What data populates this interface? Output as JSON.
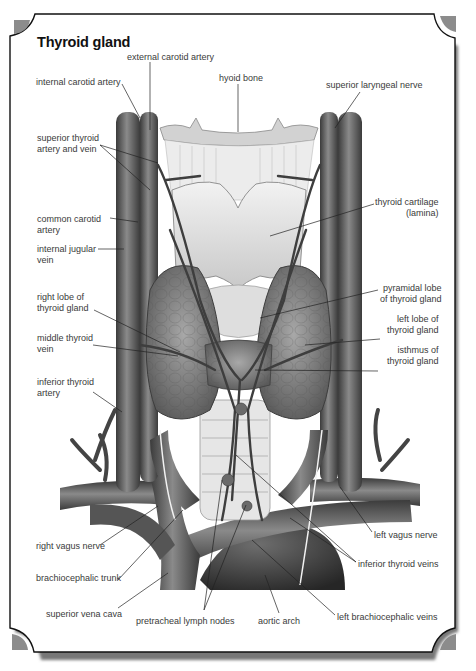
{
  "title": "Thyroid gland",
  "colors": {
    "frame_stroke": "#111111",
    "frame_shadow": "#7a7a7a",
    "corner_fill": "#8c8c8c",
    "vessel_dark": "#4a4a4a",
    "vessel_mid": "#6d6d6d",
    "cartilage": "#d9d9d9",
    "gland": "#7c7c7c",
    "label_text": "#3a3a3a",
    "leader_line": "#222222"
  },
  "labels": {
    "external_carotid_artery": "external carotid artery",
    "internal_carotid_artery": "internal carotid artery",
    "hyoid_bone": "hyoid bone",
    "superior_laryngeal_nerve": "superior laryngeal nerve",
    "superior_thyroid_artery_and_vein": [
      "superior thyroid",
      "artery and vein"
    ],
    "thyroid_cartilage_lamina": [
      "thyroid cartilage",
      "(lamina)"
    ],
    "common_carotid_artery": [
      "common carotid",
      "artery"
    ],
    "internal_jugular_vein": [
      "internal jugular",
      "vein"
    ],
    "pyramidal_lobe": [
      "pyramidal lobe",
      "of thyroid gland"
    ],
    "right_lobe": [
      "right lobe of",
      "thyroid gland"
    ],
    "left_lobe": [
      "left lobe of",
      "thyroid gland"
    ],
    "middle_thyroid_vein": [
      "middle thyroid",
      "vein"
    ],
    "isthmus": [
      "isthmus of",
      "thyroid gland"
    ],
    "inferior_thyroid_artery": [
      "inferior thyroid",
      "artery"
    ],
    "left_vagus_nerve": "left vagus nerve",
    "right_vagus_nerve": "right vagus nerve",
    "inferior_thyroid_veins": "inferior thyroid veins",
    "brachiocephalic_trunk": "brachiocephalic trunk",
    "superior_vena_cava": "superior vena cava",
    "pretracheal_lymph_nodes": "pretracheal lymph nodes",
    "aortic_arch": "aortic arch",
    "left_brachiocephalic_veins": "left brachiocephalic veins"
  }
}
